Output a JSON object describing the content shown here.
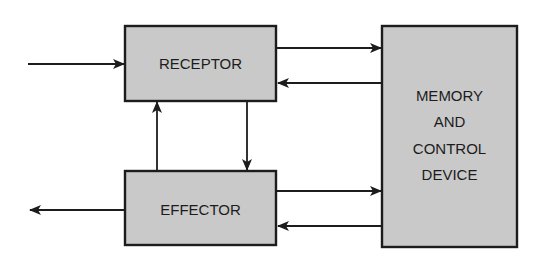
{
  "diagram": {
    "type": "block-diagram",
    "nodes": [
      {
        "id": "receptor",
        "label": "RECEPTOR"
      },
      {
        "id": "effector",
        "label": "EFFECTOR"
      },
      {
        "id": "memory",
        "label_lines": [
          "MEMORY",
          "AND",
          "CONTROL",
          "DEVICE"
        ]
      }
    ],
    "edges": [
      {
        "from": "input",
        "to": "receptor"
      },
      {
        "from": "receptor",
        "to": "memory"
      },
      {
        "from": "memory",
        "to": "receptor"
      },
      {
        "from": "receptor",
        "to": "effector"
      },
      {
        "from": "effector",
        "to": "receptor"
      },
      {
        "from": "effector",
        "to": "memory"
      },
      {
        "from": "memory",
        "to": "effector"
      },
      {
        "from": "effector",
        "to": "output"
      }
    ],
    "colors": {
      "box_fill": "#c9c9c9",
      "stroke": "#1c1c1c",
      "background": "#ffffff"
    }
  }
}
